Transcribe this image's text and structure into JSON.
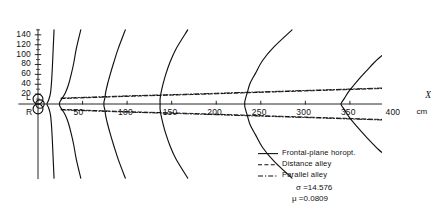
{
  "figure": {
    "background": "#ffffff",
    "ink": "#111111"
  },
  "axes": {
    "x_axis_name": "X",
    "x_unit": "cm",
    "x_ticks": [
      {
        "value": 50,
        "label": "50"
      },
      {
        "value": 100,
        "label": "100"
      },
      {
        "value": 150,
        "label": "150"
      },
      {
        "value": 200,
        "label": "200"
      },
      {
        "value": 250,
        "label": "250"
      },
      {
        "value": 300,
        "label": "300"
      },
      {
        "value": 350,
        "label": "350"
      },
      {
        "value": 400,
        "label": "400"
      }
    ],
    "y_ticks": [
      {
        "value": 140,
        "label": "140"
      },
      {
        "value": 120,
        "label": "120"
      },
      {
        "value": 100,
        "label": "100"
      },
      {
        "value": 80,
        "label": "80"
      },
      {
        "value": 60,
        "label": "60"
      },
      {
        "value": 40,
        "label": "40"
      },
      {
        "value": 20,
        "label": "20"
      }
    ],
    "eye_labels": [
      {
        "key": "L",
        "label": "L"
      },
      {
        "key": "R",
        "label": "R"
      }
    ],
    "xlim": [
      -20,
      440
    ],
    "ylim": [
      -150,
      150
    ]
  },
  "legend": {
    "entries": [
      {
        "label": "Frontal-plane horopt.",
        "style": "solid",
        "name": "frontal-plane-horopter"
      },
      {
        "label": "Distance alley",
        "style": "dashed",
        "name": "distance-alley"
      },
      {
        "label": "Parallel alley",
        "style": "dashdot",
        "name": "parallel-alley"
      }
    ],
    "params": [
      {
        "symbol": "σ",
        "separator": "=",
        "value": "14.576",
        "text": "σ =14.576"
      },
      {
        "symbol": "μ",
        "separator": "=",
        "value": "0.0809",
        "text": "μ =0.0809"
      }
    ]
  },
  "chart_data": {
    "type": "line",
    "title": "",
    "xlabel": "X",
    "ylabel": "",
    "xunit": "cm",
    "xlim": [
      -20,
      440
    ],
    "ylim": [
      -150,
      150
    ],
    "grid": false,
    "legend_position": "bottom-right",
    "annotations": [
      {
        "text": "L",
        "x": -8,
        "y": 14
      },
      {
        "text": "R",
        "x": -8,
        "y": -14
      },
      {
        "text": "cm",
        "x": 415,
        "y": -14
      },
      {
        "text": "X",
        "x": 440,
        "y": 12
      }
    ],
    "series": [
      {
        "name": "Frontal-plane horopt. 1",
        "style": "solid",
        "points": [
          [
            18,
            150
          ],
          [
            17,
            110
          ],
          [
            16,
            70
          ],
          [
            15,
            40
          ],
          [
            14,
            22
          ],
          [
            12,
            8
          ],
          [
            10,
            0
          ],
          [
            12,
            -8
          ],
          [
            14,
            -22
          ],
          [
            15,
            -40
          ],
          [
            16,
            -70
          ],
          [
            17,
            -110
          ],
          [
            18,
            -150
          ]
        ]
      },
      {
        "name": "Frontal-plane horopt. 2",
        "style": "solid",
        "points": [
          [
            48,
            150
          ],
          [
            43,
            112
          ],
          [
            40,
            82
          ],
          [
            37,
            58
          ],
          [
            34,
            38
          ],
          [
            31,
            24
          ],
          [
            28,
            14
          ],
          [
            25,
            6
          ],
          [
            24,
            0
          ],
          [
            25,
            -6
          ],
          [
            28,
            -14
          ],
          [
            31,
            -24
          ],
          [
            34,
            -38
          ],
          [
            37,
            -58
          ],
          [
            40,
            -82
          ],
          [
            43,
            -112
          ],
          [
            48,
            -150
          ]
        ]
      },
      {
        "name": "Frontal-plane horopt. 3",
        "style": "solid",
        "points": [
          [
            98,
            150
          ],
          [
            90,
            112
          ],
          [
            85,
            84
          ],
          [
            81,
            60
          ],
          [
            78,
            40
          ],
          [
            76,
            24
          ],
          [
            75,
            12
          ],
          [
            74,
            4
          ],
          [
            74,
            0
          ],
          [
            74,
            -4
          ],
          [
            75,
            -12
          ],
          [
            76,
            -24
          ],
          [
            78,
            -40
          ],
          [
            81,
            -60
          ],
          [
            85,
            -84
          ],
          [
            90,
            -112
          ],
          [
            98,
            -150
          ]
        ]
      },
      {
        "name": "Frontal-plane horopt. 4",
        "style": "solid",
        "points": [
          [
            168,
            150
          ],
          [
            155,
            112
          ],
          [
            148,
            84
          ],
          [
            143,
            58
          ],
          [
            140,
            38
          ],
          [
            138,
            22
          ],
          [
            137,
            10
          ],
          [
            137,
            2
          ],
          [
            137,
            0
          ],
          [
            137,
            -2
          ],
          [
            137,
            -10
          ],
          [
            138,
            -22
          ],
          [
            140,
            -38
          ],
          [
            143,
            -58
          ],
          [
            148,
            -84
          ],
          [
            155,
            -112
          ],
          [
            168,
            -150
          ]
        ]
      },
      {
        "name": "Frontal-plane horopt. 5",
        "style": "solid",
        "points": [
          [
            285,
            150
          ],
          [
            265,
            116
          ],
          [
            252,
            88
          ],
          [
            244,
            62
          ],
          [
            238,
            42
          ],
          [
            235,
            24
          ],
          [
            233,
            12
          ],
          [
            232,
            4
          ],
          [
            232,
            0
          ],
          [
            232,
            -4
          ],
          [
            233,
            -12
          ],
          [
            235,
            -24
          ],
          [
            238,
            -42
          ],
          [
            244,
            -62
          ],
          [
            252,
            -88
          ],
          [
            265,
            -116
          ],
          [
            285,
            -150
          ]
        ]
      },
      {
        "name": "Frontal-plane horopt. 6",
        "style": "solid",
        "points": [
          [
            430,
            150
          ],
          [
            400,
            118
          ],
          [
            382,
            92
          ],
          [
            368,
            66
          ],
          [
            357,
            44
          ],
          [
            349,
            26
          ],
          [
            344,
            12
          ],
          [
            341,
            4
          ],
          [
            340,
            0
          ],
          [
            341,
            -4
          ],
          [
            344,
            -12
          ],
          [
            349,
            -26
          ],
          [
            357,
            -44
          ],
          [
            368,
            -66
          ],
          [
            382,
            -92
          ],
          [
            400,
            -118
          ],
          [
            430,
            -150
          ]
        ]
      },
      {
        "name": "Distance alley (upper)",
        "style": "dashed",
        "points": [
          [
            26,
            11
          ],
          [
            60,
            13
          ],
          [
            110,
            16
          ],
          [
            170,
            19
          ],
          [
            240,
            23
          ],
          [
            310,
            27
          ],
          [
            380,
            31
          ],
          [
            420,
            33
          ]
        ]
      },
      {
        "name": "Distance alley (lower)",
        "style": "dashed",
        "points": [
          [
            26,
            -11
          ],
          [
            60,
            -13
          ],
          [
            110,
            -16
          ],
          [
            170,
            -19
          ],
          [
            240,
            -23
          ],
          [
            310,
            -27
          ],
          [
            380,
            -31
          ],
          [
            420,
            -33
          ]
        ]
      },
      {
        "name": "Parallel alley (upper)",
        "style": "dashdot",
        "points": [
          [
            26,
            12
          ],
          [
            60,
            14
          ],
          [
            110,
            17
          ],
          [
            170,
            20
          ],
          [
            240,
            24
          ],
          [
            310,
            28
          ],
          [
            380,
            32
          ],
          [
            420,
            34
          ]
        ]
      },
      {
        "name": "Parallel alley (lower)",
        "style": "dashdot",
        "points": [
          [
            26,
            -12
          ],
          [
            60,
            -14
          ],
          [
            110,
            -17
          ],
          [
            170,
            -20
          ],
          [
            240,
            -24
          ],
          [
            310,
            -28
          ],
          [
            380,
            -32
          ],
          [
            420,
            -34
          ]
        ]
      }
    ],
    "eyes": {
      "description": "Eye positions at origin drawn as circles",
      "left": {
        "cx": 0,
        "cy": 10,
        "r": 10
      },
      "right": {
        "cx": 0,
        "cy": -10,
        "r": 10
      }
    }
  }
}
